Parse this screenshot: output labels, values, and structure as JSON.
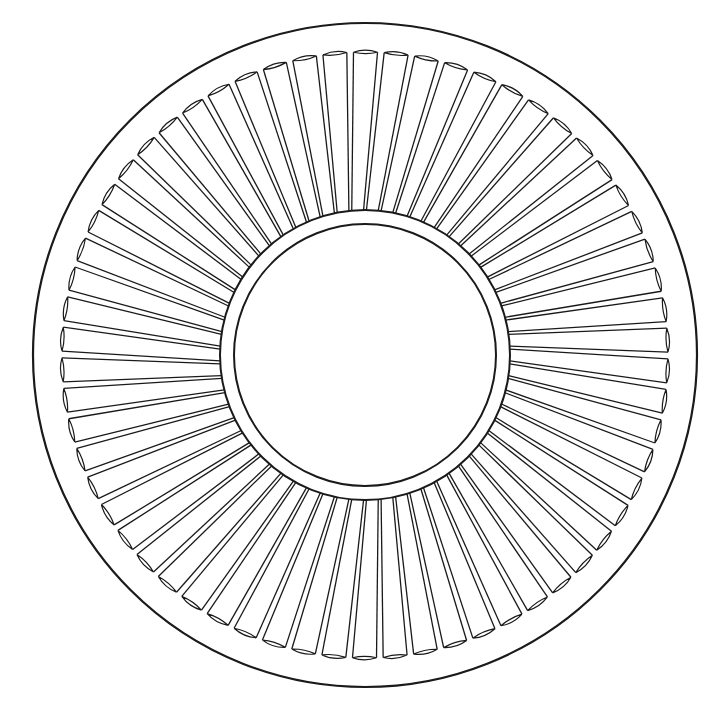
{
  "diagram": {
    "type": "line-drawing",
    "background": "#ffffff",
    "stroke_color": "#1a1a1a",
    "center": [
      365,
      355
    ],
    "outer_rim_radius": 332,
    "blade_outer_radius": 303,
    "hub_ring_outer_radius": 145,
    "hub_ring_inner_radius": 131,
    "blade_count": 62,
    "blade_skew_deg": 3
  }
}
